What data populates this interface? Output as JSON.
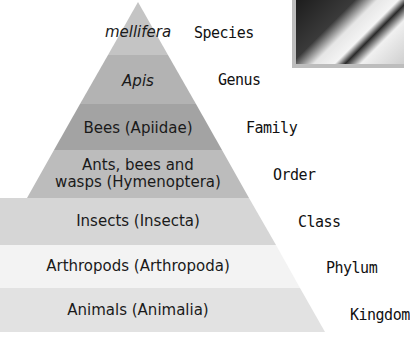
{
  "diagram": {
    "layers": [
      {
        "name": "mellifera",
        "rank": "Species",
        "italic": true,
        "color": "#c4c4c4"
      },
      {
        "name": "Apis",
        "rank": "Genus",
        "italic": true,
        "color": "#b3b3b3"
      },
      {
        "name": "Bees (Apiidae)",
        "rank": "Family",
        "italic": false,
        "color": "#a3a3a3"
      },
      {
        "name_line1": "Ants, bees and",
        "name_line2": "wasps (Hymenoptera)",
        "rank": "Order",
        "italic": false,
        "color": "#bcbcbc"
      },
      {
        "name": "Insects (Insecta)",
        "rank": "Class",
        "italic": false,
        "color": "#d6d6d6"
      },
      {
        "name": "Arthropods (Arthropoda)",
        "rank": "Phylum",
        "italic": false,
        "color": "#f3f3f3"
      },
      {
        "name": "Animals (Animalia)",
        "rank": "Kingdom",
        "italic": false,
        "color": "#e2e2e2"
      }
    ],
    "photo": {
      "description": "black-and-white photo inset (top-right, partially cropped)"
    }
  }
}
